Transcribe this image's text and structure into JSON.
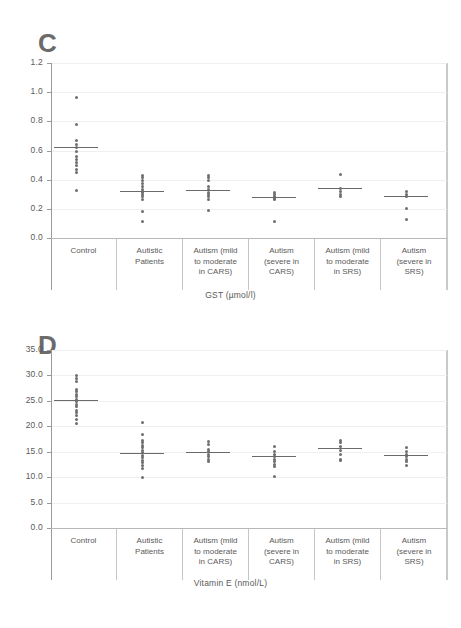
{
  "figure": {
    "panels": [
      {
        "letter": "C",
        "axis_title": "GST (µmol/l)"
      },
      {
        "letter": "D",
        "axis_title": "Vitamin E (nmol/L)"
      }
    ]
  },
  "chart_data": [
    {
      "type": "scatter",
      "title": "C",
      "xlabel": "GST (µmol/l)",
      "ylabel": "",
      "ylim": [
        0.0,
        1.2
      ],
      "yticks": [
        "0.0",
        "0.2",
        "0.4",
        "0.6",
        "0.8",
        "1.0",
        "1.2"
      ],
      "ytick_values": [
        0.0,
        0.2,
        0.4,
        0.6,
        0.8,
        1.0,
        1.2
      ],
      "grid": true,
      "legend": "none",
      "categories": [
        "Control",
        "Autistic\nPatients",
        "Autism (mild\nto moderate\nin CARS)",
        "Autism\n(severe in\nCARS)",
        "Autism (mild\nto moderate\nin SRS)",
        "Autism\n(severe in\nSRS)"
      ],
      "groups": [
        {
          "name": "Control",
          "mean": 0.625,
          "values": [
            0.97,
            0.78,
            0.67,
            0.645,
            0.625,
            0.6,
            0.565,
            0.545,
            0.52,
            0.5,
            0.475,
            0.455,
            0.33
          ]
        },
        {
          "name": "Autistic Patients",
          "mean": 0.325,
          "values": [
            0.435,
            0.42,
            0.395,
            0.375,
            0.355,
            0.335,
            0.325,
            0.315,
            0.3,
            0.285,
            0.265,
            0.185,
            0.115
          ]
        },
        {
          "name": "Autism (mild to moderate in CARS)",
          "mean": 0.33,
          "values": [
            0.435,
            0.42,
            0.395,
            0.355,
            0.335,
            0.315,
            0.3,
            0.285,
            0.265,
            0.19
          ]
        },
        {
          "name": "Autism (severe in CARS)",
          "mean": 0.28,
          "values": [
            0.315,
            0.3,
            0.285,
            0.275,
            0.265,
            0.12
          ]
        },
        {
          "name": "Autism (mild to moderate in SRS)",
          "mean": 0.34,
          "values": [
            0.44,
            0.345,
            0.325,
            0.305,
            0.285
          ]
        },
        {
          "name": "Autism (severe in SRS)",
          "mean": 0.29,
          "values": [
            0.325,
            0.305,
            0.29,
            0.205,
            0.13
          ]
        }
      ]
    },
    {
      "type": "scatter",
      "title": "D",
      "xlabel": "Vitamin E (nmol/L)",
      "ylabel": "",
      "ylim": [
        0.0,
        35.0
      ],
      "yticks": [
        "0.0",
        "5.0",
        "10.0",
        "15.0",
        "20.0",
        "25.0",
        "30.0",
        "35.0"
      ],
      "ytick_values": [
        0.0,
        5.0,
        10.0,
        15.0,
        20.0,
        25.0,
        30.0,
        35.0
      ],
      "grid": true,
      "legend": "none",
      "categories": [
        "Control",
        "Autistic\nPatients",
        "Autism (mild\nto moderate\nin CARS)",
        "Autism\n(severe in\nCARS)",
        "Autism (mild\nto moderate\nin SRS)",
        "Autism\n(severe in\nSRS)"
      ],
      "groups": [
        {
          "name": "Control",
          "mean": 25.2,
          "values": [
            30.0,
            29.4,
            28.9,
            27.4,
            26.9,
            26.4,
            25.9,
            25.4,
            24.9,
            24.4,
            23.9,
            23.3,
            22.8,
            22.3,
            21.5,
            20.7
          ]
        },
        {
          "name": "Autistic Patients",
          "mean": 14.8,
          "values": [
            20.9,
            18.4,
            17.4,
            16.9,
            16.4,
            15.9,
            15.4,
            14.9,
            14.4,
            13.9,
            13.4,
            12.9,
            12.4,
            11.8,
            10.1
          ]
        },
        {
          "name": "Autism (mild to moderate in CARS)",
          "mean": 14.9,
          "values": [
            17.2,
            16.6,
            15.6,
            15.1,
            14.6,
            14.1,
            13.6,
            13.1
          ]
        },
        {
          "name": "Autism (severe in CARS)",
          "mean": 14.1,
          "values": [
            16.1,
            15.1,
            14.6,
            14.1,
            13.6,
            13.1,
            12.6,
            12.1,
            10.3
          ]
        },
        {
          "name": "Autism (mild to moderate in SRS)",
          "mean": 15.7,
          "values": [
            17.4,
            16.9,
            16.1,
            15.4,
            14.6,
            13.6,
            13.3
          ]
        },
        {
          "name": "Autism (severe in SRS)",
          "mean": 14.3,
          "values": [
            16.0,
            15.1,
            14.6,
            14.1,
            13.6,
            13.1,
            12.4
          ]
        }
      ]
    }
  ]
}
